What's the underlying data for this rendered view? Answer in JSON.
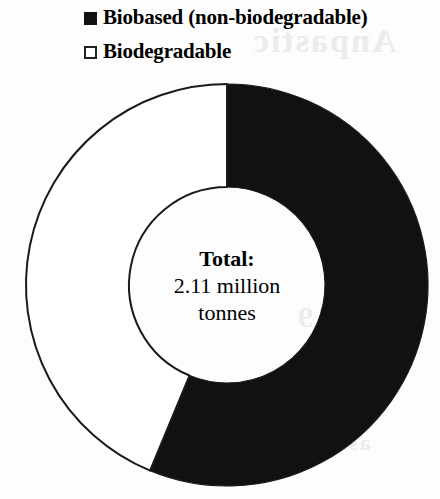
{
  "chart_data": {
    "type": "pie",
    "variant": "donut",
    "title": "",
    "subtitle": "",
    "xlabel": "",
    "ylabel": "",
    "categories": [
      "Biobased (non-biodegradable)",
      "Biodegradable"
    ],
    "values": [
      1.18,
      0.93
    ],
    "value_unit": "million tonnes",
    "percentages": [
      56.0,
      44.0
    ],
    "slices": [
      {
        "label": "Biobased (non-biodegradable)",
        "value": 1.18,
        "percent": 56.0,
        "color": "#111111",
        "start_angle_deg": 0,
        "end_angle_deg": 202.5
      },
      {
        "label": "Biodegradable",
        "value": 0.93,
        "percent": 44.0,
        "color": "#ffffff",
        "start_angle_deg": 202.5,
        "end_angle_deg": 360
      }
    ],
    "center_annotation": {
      "line1": "Total:",
      "line2": "2.11 million",
      "line3": "tonnes",
      "total_value": 2.11,
      "total_unit": "million tonnes"
    },
    "legend": {
      "position": "top",
      "entries": [
        {
          "label": "Biobased (non-biodegradable)",
          "marker": "filled-square",
          "color": "#111111"
        },
        {
          "label": "Biodegradable",
          "marker": "hollow-square",
          "color": "#ffffff"
        }
      ]
    },
    "grid": false,
    "axis_ranges": null
  },
  "legend": {
    "entries": [
      {
        "label": "Biobased (non-biodegradable)"
      },
      {
        "label": "Biodegradable"
      }
    ]
  },
  "center": {
    "line1": "Total:",
    "line2": "2.11 million",
    "line3": "tonnes"
  },
  "artifact": {
    "bleed_1": "Anpastic",
    "bleed_2": "Global",
    "bleed_3": "2019",
    "bleed_4": "association"
  }
}
